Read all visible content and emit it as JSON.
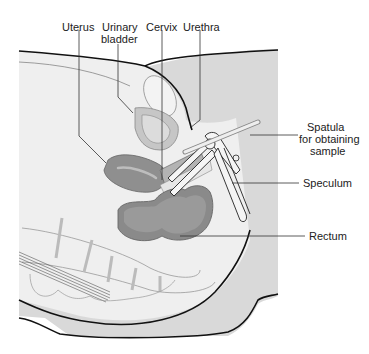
{
  "diagram": {
    "type": "anatomical cross-section",
    "labels": {
      "uterus": "Uterus",
      "urinary_bladder_1": "Urinary",
      "urinary_bladder_2": "bladder",
      "cervix": "Cervix",
      "urethra": "Urethra",
      "spatula_1": "Spatula",
      "spatula_2": "for obtaining",
      "spatula_3": "sample",
      "speculum": "Speculum",
      "rectum": "Rectum"
    },
    "colors": {
      "background": "#ffffff",
      "body_fill": "#ededed",
      "body_shadow": "#d9d9d9",
      "organ_dark": "#8c8c8c",
      "organ_mid": "#b5b5b5",
      "organ_light": "#d0d0d0",
      "outline": "#111111",
      "leader": "#333333"
    }
  }
}
